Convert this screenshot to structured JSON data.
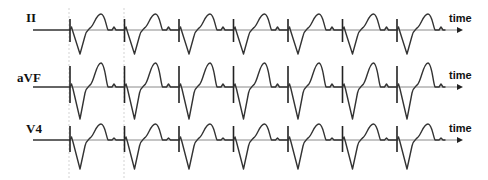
{
  "figure": {
    "type": "ecg-lead-strips",
    "colors": {
      "trace": "#333333",
      "baseline": "#8a8a8a",
      "guide": "#c8c8c8",
      "text": "#111111"
    },
    "beat_onsets_x": [
      70,
      124.5,
      179,
      233.5,
      288,
      342.5,
      397
    ],
    "guide_lines_x": [
      69,
      124
    ],
    "axis_end_x": 463,
    "leads": [
      {
        "label": "II",
        "axis_label": "time",
        "baseline_y": 30,
        "spike_top": -11,
        "spike_bottom": 12,
        "trough": 24,
        "t_peak": -16,
        "bump": -3
      },
      {
        "label": "aVF",
        "axis_label": "time",
        "baseline_y": 87,
        "spike_top": -21,
        "spike_bottom": 16,
        "trough": 32,
        "t_peak": -24,
        "bump": -3
      },
      {
        "label": "V4",
        "axis_label": "time",
        "baseline_y": 140,
        "spike_top": -14,
        "spike_bottom": 12,
        "trough": 29,
        "t_peak": -16,
        "bump": -2
      }
    ]
  }
}
